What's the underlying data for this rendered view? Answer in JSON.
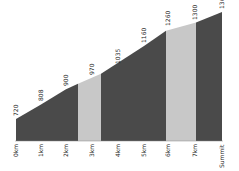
{
  "chart_data": {
    "type": "area",
    "title": "",
    "xlabel": "",
    "ylabel": "",
    "categories": [
      "0km",
      "1km",
      "2km",
      "3km",
      "4km",
      "5km",
      "6km",
      "7km",
      "Summit"
    ],
    "values": [
      720,
      808,
      900,
      970,
      1035,
      1160,
      1260,
      1300,
      1365
    ],
    "value_labels": [
      "720",
      "808",
      "900",
      "970",
      "1035",
      "1160",
      "1260",
      "1300",
      "1365"
    ],
    "segment_colors": [
      "#4a4a4a",
      "#4a4a4a",
      "#4a4a4a",
      "#c8c8c8",
      "#4a4a4a",
      "#4a4a4a",
      "#c8c8c8",
      "#4a4a4a"
    ],
    "grid": false,
    "legend": "none"
  },
  "colors": {
    "dark": "#4a4a4a",
    "light": "#c8c8c8",
    "text": "#222222"
  }
}
